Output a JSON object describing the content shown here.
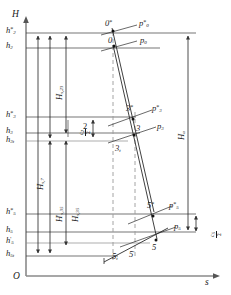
{
  "diagram": {
    "type": "h-s-expansion-diagram",
    "axes": {
      "vertical_label": "H",
      "horizontal_label": "s",
      "origin_label": "O"
    },
    "enthalpy_levels": [
      {
        "id": "h2star",
        "label_main": "h",
        "sub": "2",
        "sup": "*",
        "y": 33
      },
      {
        "id": "h2",
        "label_main": "h",
        "sub": "2",
        "sup": "",
        "y": 48
      },
      {
        "id": "h3star",
        "label_main": "h",
        "sub": "3",
        "sup": "*",
        "y": 117
      },
      {
        "id": "h3",
        "label_main": "h",
        "sub": "3",
        "sup": "",
        "y": 133
      },
      {
        "id": "h3t",
        "label_main": "h",
        "sub": "3t",
        "sup": "",
        "y": 141
      },
      {
        "id": "h5star",
        "label_main": "h",
        "sub": "5",
        "sup": "*",
        "y": 214
      },
      {
        "id": "h5",
        "label_main": "h",
        "sub": "5",
        "sup": "",
        "y": 232
      },
      {
        "id": "h5prime",
        "label_main": "h",
        "sub": "5",
        "sup": "'",
        "y": 243
      },
      {
        "id": "h5t",
        "label_main": "h",
        "sub": "5t",
        "sup": "",
        "y": 256
      }
    ],
    "state_points": [
      {
        "id": "p0star",
        "label": "0",
        "sup": "*",
        "px": 113,
        "py": 29
      },
      {
        "id": "p0",
        "label": "0",
        "sup": "",
        "px": 113,
        "py": 45
      },
      {
        "id": "p3star",
        "label": "3",
        "sup": "*",
        "px": 132,
        "py": 114
      },
      {
        "id": "p3",
        "label": "3",
        "sup": "",
        "px": 133,
        "py": 131
      },
      {
        "id": "p3t",
        "label": "3",
        "sub": "t",
        "px": 120,
        "py": 148
      },
      {
        "id": "p5star",
        "label": "5",
        "sup": "*",
        "px": 153,
        "py": 212
      },
      {
        "id": "p5",
        "label": "5",
        "sup": "",
        "px": 156,
        "py": 238
      },
      {
        "id": "p5prime",
        "label": "5",
        "sup": "'",
        "px": 133,
        "py": 254
      },
      {
        "id": "p5t",
        "label": "5",
        "sub": "t",
        "px": 118,
        "py": 256
      }
    ],
    "isobars": [
      {
        "id": "p0star",
        "label": "p",
        "sub": "0",
        "sup": "*"
      },
      {
        "id": "p0",
        "label": "p",
        "sub": "0",
        "sup": ""
      },
      {
        "id": "p3star",
        "label": "p",
        "sub": "3",
        "sup": "*"
      },
      {
        "id": "p3",
        "label": "p",
        "sub": "3",
        "sup": ""
      },
      {
        "id": "p5star",
        "label": "p",
        "sub": "5",
        "sup": "*"
      },
      {
        "id": "p5",
        "label": "p",
        "sub": "5",
        "sup": ""
      }
    ],
    "heat_drops": [
      {
        "id": "Hs23",
        "label": "H",
        "sub": "s,23",
        "prime": "",
        "x": 55,
        "y": 95
      },
      {
        "id": "Hs7",
        "label": "H",
        "sub": "s,7",
        "prime": "",
        "x": 36,
        "y": 190
      },
      {
        "id": "Hs35prime",
        "label": "H",
        "sub": "s,35",
        "prime": "'",
        "x": 58,
        "y": 215
      },
      {
        "id": "Hs35",
        "label": "H",
        "sub": "s,35",
        "prime": "",
        "x": 73,
        "y": 215
      },
      {
        "id": "Ha",
        "label": "H",
        "sub": "a",
        "prime": "",
        "x": 174,
        "y": 140
      }
    ],
    "loss_labels": [
      {
        "id": "zeta2",
        "num": "c",
        "den": "2",
        "sub": "2",
        "x": 72,
        "y": 130
      },
      {
        "id": "num2",
        "text": "2",
        "x": 85,
        "y": 124
      },
      {
        "id": "zeta5",
        "num": "c",
        "den": "2",
        "sub": "5",
        "x": 203,
        "y": 232
      }
    ]
  }
}
